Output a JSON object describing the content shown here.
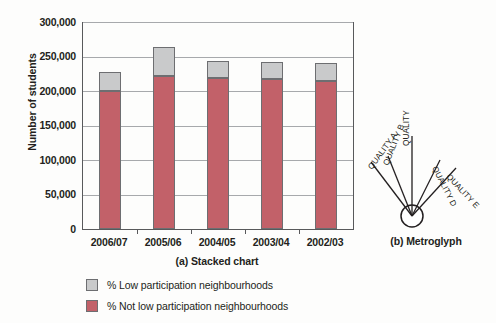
{
  "figure": {
    "panels": [
      {
        "caption": "(a) Stacked chart"
      },
      {
        "caption": "(b) Metroglyph"
      }
    ]
  },
  "chart_data": {
    "type": "bar",
    "subtype": "stacked-bar",
    "title": "",
    "xlabel": "",
    "ylabel": "Number of students",
    "categories": [
      "2006/07",
      "2005/06",
      "2004/05",
      "2003/04",
      "2002/03"
    ],
    "series": [
      {
        "name": "% Not low participation neighbourhoods",
        "color": "#c26169",
        "values": [
          200000,
          222000,
          219000,
          217000,
          214000
        ]
      },
      {
        "name": "% Low participation neighbourhoods",
        "color": "#c9cacb",
        "values": [
          27000,
          42000,
          24000,
          25000,
          27000
        ]
      }
    ],
    "totals": [
      227000,
      264000,
      243000,
      242000,
      241000
    ],
    "ylim": [
      0,
      300000
    ],
    "ytick_values": [
      0,
      50000,
      100000,
      150000,
      200000,
      250000,
      300000
    ],
    "ytick_labels": [
      "0",
      "50,000",
      "100,000",
      "150,000",
      "200,000",
      "250,000",
      "300,000"
    ],
    "grid": true,
    "legend_position": "bottom-left",
    "stack_order": [
      "% Not low participation neighbourhoods",
      "% Low participation neighbourhoods"
    ]
  },
  "legend": {
    "items": [
      {
        "label": "% Low participation neighbourhoods",
        "swatch": "grey"
      },
      {
        "label": "% Not low participation neighbourhoods",
        "swatch": "red"
      }
    ]
  },
  "metroglyph": {
    "rays": [
      {
        "label": "QUALITY A"
      },
      {
        "label": "QUALITY B"
      },
      {
        "label": "QUALITY C"
      },
      {
        "label": "QUALITY D"
      },
      {
        "label": "QUALITY E"
      }
    ]
  },
  "colors": {
    "red": "#c26169",
    "grey": "#c9cacb",
    "outline": "#6d6e71",
    "axis": "#58595b",
    "gridline": "#a7a9ac",
    "text": "#231f20"
  }
}
